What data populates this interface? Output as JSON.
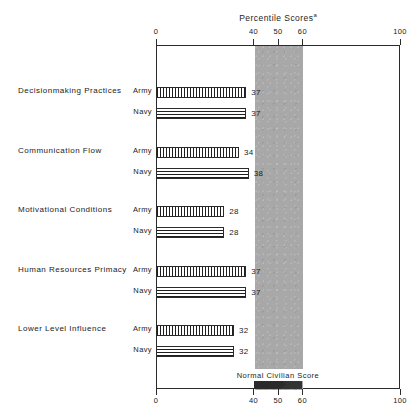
{
  "chart_data": {
    "type": "bar",
    "title": "Percentile Scores",
    "title_superscript": "a",
    "orientation": "horizontal",
    "xlabel": "",
    "ylabel": "",
    "xlim": [
      0,
      100
    ],
    "grid": false,
    "axis_top_ticks": [
      "0",
      "40",
      "50",
      "60",
      "100"
    ],
    "axis_bottom_ticks": [
      "0",
      "40",
      "50",
      "60",
      "100"
    ],
    "tick_values": [
      0,
      40,
      50,
      60,
      100
    ],
    "categories": [
      "Decisionmaking Practices",
      "Communication Flow",
      "Motivational Conditions",
      "Human Resources Primacy",
      "Lower Level Influence"
    ],
    "series": [
      {
        "name": "Army",
        "values": [
          37,
          34,
          28,
          37,
          32
        ]
      },
      {
        "name": "Navy",
        "values": [
          37,
          38,
          28,
          37,
          32
        ]
      }
    ],
    "annotations": [
      {
        "text": "Normal Civilian Score",
        "type": "band-label",
        "band_start": 40,
        "band_end": 60,
        "band_color": "#a8a8a8"
      }
    ],
    "legend_position": "none"
  },
  "rows": [
    {
      "category": "Decisionmaking Practices",
      "bars": [
        {
          "series": "Army",
          "value": 37,
          "value_label": "37"
        },
        {
          "series": "Navy",
          "value": 37,
          "value_label": "37"
        }
      ]
    },
    {
      "category": "Communication Flow",
      "bars": [
        {
          "series": "Army",
          "value": 34,
          "value_label": "34"
        },
        {
          "series": "Navy",
          "value": 38,
          "value_label": "38"
        }
      ]
    },
    {
      "category": "Motivational Conditions",
      "bars": [
        {
          "series": "Army",
          "value": 28,
          "value_label": "28"
        },
        {
          "series": "Navy",
          "value": 28,
          "value_label": "28"
        }
      ]
    },
    {
      "category": "Human Resources Primacy",
      "bars": [
        {
          "series": "Army",
          "value": 37,
          "value_label": "37"
        },
        {
          "series": "Navy",
          "value": 37,
          "value_label": "37"
        }
      ]
    },
    {
      "category": "Lower Level Influence",
      "bars": [
        {
          "series": "Army",
          "value": 32,
          "value_label": "32"
        },
        {
          "series": "Navy",
          "value": 32,
          "value_label": "32"
        }
      ]
    }
  ],
  "band": {
    "label": "Normal Civilian Score",
    "color": "#a8a8a8"
  },
  "title": {
    "text": "Percentile Scores",
    "superscript": "a"
  }
}
